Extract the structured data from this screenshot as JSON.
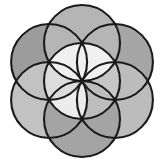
{
  "figure": {
    "title": "Seed of Life",
    "type": "geometric-diagram"
  },
  "canvas": {
    "width": 164,
    "height": 164,
    "background_color": "#ffffff"
  },
  "geometry": {
    "center_x": 82,
    "center_y": 81,
    "radius": 38,
    "circle_count": 7,
    "petal_count": 6,
    "bounds": {
      "left": 10,
      "top": 5,
      "right": 155,
      "bottom": 157
    },
    "circles": [
      {
        "name": "center",
        "cx": 82,
        "cy": 81,
        "r": 38
      },
      {
        "name": "top",
        "cx": 82,
        "cy": 43,
        "r": 38
      },
      {
        "name": "upper-right",
        "cx": 114.9,
        "cy": 62,
        "r": 38
      },
      {
        "name": "lower-right",
        "cx": 114.9,
        "cy": 100,
        "r": 38
      },
      {
        "name": "bottom",
        "cx": 82,
        "cy": 119,
        "r": 38
      },
      {
        "name": "lower-left",
        "cx": 49.1,
        "cy": 100,
        "r": 38
      },
      {
        "name": "upper-left",
        "cx": 49.1,
        "cy": 62,
        "r": 38
      }
    ]
  },
  "style": {
    "stroke_color": "#1a1a1a",
    "stroke_width": 2.1,
    "fill_base": "#a8a8a8",
    "fill_outer_dark": "#9a9a9a",
    "fill_outer_light": "#bdbdbd",
    "fill_mid": "#b2b2b2",
    "fill_petal_light": "#e8e8e8",
    "fill_petal_white": "#f4f4f4",
    "fill_center": "#cfcfcf"
  },
  "shading": {
    "top_lobe": "#b5b5b5",
    "upper_left_lobe": "#9c9c9c",
    "upper_right_lobe": "#a6a6a6",
    "lower_left_lobe": "#c2c2c2",
    "lower_right_lobe": "#bcbcbc",
    "bottom_lobe": "#a4a4a4",
    "center_rosette": "#c8c8c8",
    "petal_top": "#f0f0f0",
    "petal_upper_right": "#d6d6d6",
    "petal_lower_right": "#c6c6c6",
    "petal_bottom": "#bdbdbd",
    "petal_lower_left": "#ececec",
    "petal_upper_left": "#dcdcdc"
  }
}
